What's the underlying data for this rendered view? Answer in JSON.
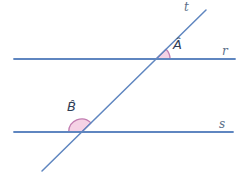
{
  "diagram": {
    "type": "geometry-figure",
    "labels": {
      "t": "t",
      "r": "r",
      "s": "s",
      "angle_a": "Â",
      "angle_b": "B̂"
    },
    "lines": [
      {
        "id": "r",
        "label": "r",
        "kind": "horizontal parallel line (top)"
      },
      {
        "id": "s",
        "label": "s",
        "kind": "horizontal parallel line (bottom)"
      },
      {
        "id": "t",
        "label": "t",
        "kind": "transversal, rising left-to-right"
      }
    ],
    "angles": [
      {
        "id": "A",
        "label": "Â",
        "vertex": "intersection of t and r",
        "position": "acute angle above r, right of t"
      },
      {
        "id": "B",
        "label": "B̂",
        "vertex": "intersection of t and s",
        "position": "obtuse angle above s, left of t"
      }
    ],
    "colors": {
      "line_blue": "#5f86c0",
      "angle_fill": "#f5d2e5",
      "angle_stroke": "#c27db1",
      "line_label": "#5c6f8a",
      "angle_label": "#2e3c55"
    }
  }
}
